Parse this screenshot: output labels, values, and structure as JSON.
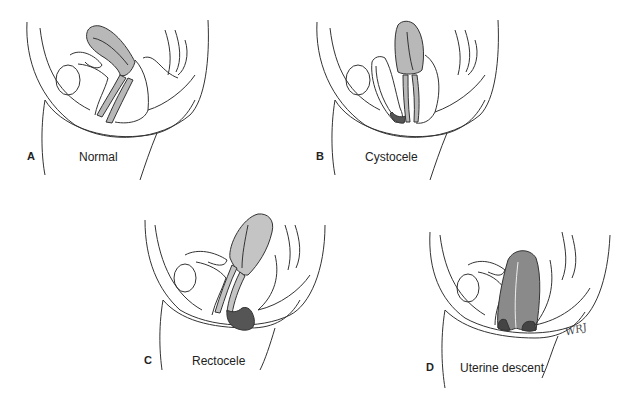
{
  "figure": {
    "panels": [
      {
        "letter": "A",
        "caption": "Normal",
        "organ_fill": "#b8b8b8",
        "highlight_fill": null
      },
      {
        "letter": "B",
        "caption": "Cystocele",
        "organ_fill": "#b8b8b8",
        "highlight_fill": "#555555"
      },
      {
        "letter": "C",
        "caption": "Rectocele",
        "organ_fill": "#c4c4c4",
        "highlight_fill": "#555555"
      },
      {
        "letter": "D",
        "caption": "Uterine descent",
        "organ_fill": "#8a8a8a",
        "highlight_fill": "#444444"
      }
    ],
    "signature": "WRJ"
  },
  "colors": {
    "line": "#333333",
    "background": "#ffffff"
  }
}
